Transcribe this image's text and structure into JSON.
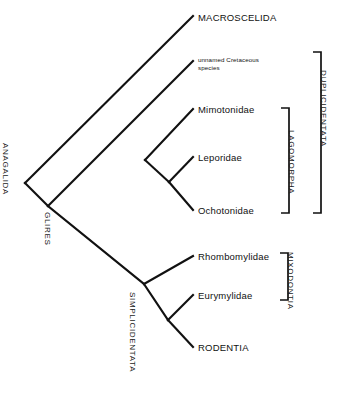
{
  "diagram": {
    "type": "cladogram",
    "background_color": "#ffffff",
    "line_color": "#111111"
  },
  "tips": [
    {
      "id": "macroscelida",
      "label": "MACROSCELIDA",
      "x": 198,
      "y": 13,
      "style": "normal"
    },
    {
      "id": "unnamed-cretaceous",
      "label": "unnamed Cretaceous species",
      "x": 198,
      "y": 56,
      "style": "small"
    },
    {
      "id": "mimotonidae",
      "label": "Mimotonidae",
      "x": 198,
      "y": 105,
      "style": "normal"
    },
    {
      "id": "leporidae",
      "label": "Leporidae",
      "x": 198,
      "y": 153,
      "style": "normal"
    },
    {
      "id": "ochotonidae",
      "label": "Ochotonidae",
      "x": 198,
      "y": 206,
      "style": "normal"
    },
    {
      "id": "rhombomylidae",
      "label": "Rhombomylidae",
      "x": 198,
      "y": 252,
      "style": "normal"
    },
    {
      "id": "eurymylidae",
      "label": "Eurymylidae",
      "x": 198,
      "y": 291,
      "style": "normal"
    },
    {
      "id": "rodentia",
      "label": "RODENTIA",
      "x": 198,
      "y": 343,
      "style": "normal"
    }
  ],
  "nodes": [
    {
      "id": "anagalida",
      "label": "ANAGALIDA",
      "x": 10,
      "y": 143
    },
    {
      "id": "glires",
      "label": "GLIRES",
      "x": 52,
      "y": 212
    },
    {
      "id": "simplicidentata",
      "label": "SIMPLICIDENTATA",
      "x": 137,
      "y": 292
    }
  ],
  "brackets": [
    {
      "id": "lagomorpha",
      "label": "LAGOMORPHA",
      "x": 288,
      "top": 108,
      "bottom": 213,
      "label_x": 296,
      "label_y": 130
    },
    {
      "id": "duplicidentata",
      "label": "DUPLICIDENTATA",
      "x": 320,
      "top": 52,
      "bottom": 213,
      "label_x": 328,
      "label_y": 70
    },
    {
      "id": "mixodontia",
      "label": "MIXODONTIA",
      "x": 287,
      "top": 253,
      "bottom": 300,
      "label_x": 295,
      "label_y": 252
    }
  ],
  "edges": [
    {
      "id": "root-to-macroscelida",
      "from": "anagalida",
      "to": "macroscelida"
    },
    {
      "id": "root-to-glires",
      "from": "anagalida",
      "to": "glires"
    },
    {
      "id": "glires-to-unnamed",
      "from": "glires",
      "to": "unnamed-cretaceous"
    },
    {
      "id": "glires-to-simplici",
      "from": "glires",
      "to": "simplicidentata"
    },
    {
      "id": "dup-to-mimotonidae",
      "from": "duplicidentata-node",
      "to": "mimotonidae"
    },
    {
      "id": "lago-to-leporidae",
      "from": "lagomorpha-node",
      "to": "leporidae"
    },
    {
      "id": "lago-to-ochotonidae",
      "from": "lagomorpha-node",
      "to": "ochotonidae"
    },
    {
      "id": "simplici-to-rhombo",
      "from": "simplicidentata",
      "to": "rhombomylidae"
    },
    {
      "id": "mixo-to-eurymylidae",
      "from": "mixodontia-node",
      "to": "eurymylidae"
    },
    {
      "id": "mixo-to-rodentia",
      "from": "mixodontia-node",
      "to": "rodentia"
    }
  ]
}
